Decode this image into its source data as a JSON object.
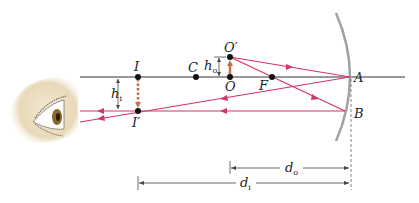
{
  "diagram": {
    "type": "concave-mirror-ray-diagram",
    "colors": {
      "axis": "#333333",
      "ray": "#d6336c",
      "mirror": "#9aa59c",
      "arrow_object": "#c0704a",
      "dim": "#444444",
      "eye_skin": "#efe3c8"
    },
    "points": {
      "I": "I",
      "I_prime": "I′",
      "C": "C",
      "O": "O",
      "O_prime": "O′",
      "F": "F",
      "A": "A",
      "B": "B"
    },
    "heights": {
      "h_i": {
        "main": "h",
        "sub": "i"
      },
      "h_o": {
        "main": "h",
        "sub": "o"
      }
    },
    "distances": {
      "d_o": {
        "main": "d",
        "sub": "o"
      },
      "d_i": {
        "main": "d",
        "sub": "i"
      }
    },
    "observer": "eye-icon"
  }
}
